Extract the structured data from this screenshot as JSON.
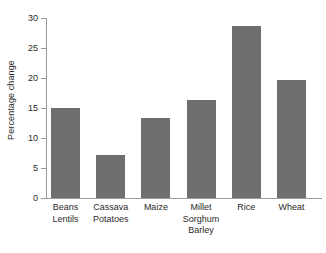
{
  "chart_data": {
    "type": "bar",
    "title": "",
    "xlabel": "",
    "ylabel": "Percentage change",
    "ylim": [
      0,
      30
    ],
    "yticks": [
      0,
      5,
      10,
      15,
      20,
      25,
      30
    ],
    "ytick_labels": [
      "0",
      "5",
      "10",
      "15",
      "20",
      "25",
      "30"
    ],
    "grid": false,
    "legend": null,
    "bar_color": "#6e6e6e",
    "categories": [
      "Beans Lentils",
      "Cassava Potatoes",
      "Maize",
      "Millet Sorghum Barley",
      "Rice",
      "Wheat"
    ],
    "category_lines": [
      [
        "Beans",
        "Lentils"
      ],
      [
        "Cassava",
        "Potatoes"
      ],
      [
        "Maize"
      ],
      [
        "Millet",
        "Sorghum",
        "Barley"
      ],
      [
        "Rice"
      ],
      [
        "Wheat"
      ]
    ],
    "values": [
      15.0,
      7.2,
      13.4,
      16.4,
      28.6,
      19.7
    ]
  }
}
